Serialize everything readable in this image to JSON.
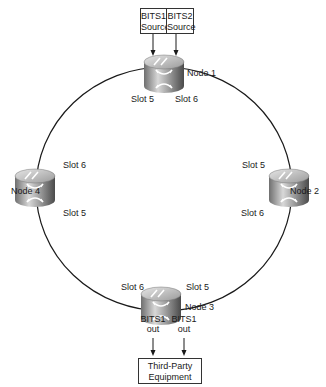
{
  "sources": [
    {
      "line1": "BITS1",
      "line2": "Source"
    },
    {
      "line1": "BITS2",
      "line2": "Source"
    }
  ],
  "nodes": [
    {
      "id": "node1",
      "label": "Node 1",
      "slots": [
        "Slot 5",
        "Slot 6"
      ]
    },
    {
      "id": "node2",
      "label": "Node 2",
      "slots": [
        "Slot 5",
        "Slot 6"
      ]
    },
    {
      "id": "node3",
      "label": "Node 3",
      "slots": [
        "Slot 6",
        "Slot 5"
      ]
    },
    {
      "id": "node4",
      "label": "Node 4",
      "slots": [
        "Slot 6",
        "Slot 5"
      ]
    }
  ],
  "outputs": [
    {
      "line1": "BITS1",
      "line2": "out"
    },
    {
      "line1": "BITS1",
      "line2": "out"
    }
  ],
  "equipment": {
    "line1": "Third-Party",
    "line2": "Equipment"
  },
  "colors": {
    "line": "#1a1a1a",
    "node_body": "#8a8a8a",
    "node_top": "#b5b5b5"
  }
}
